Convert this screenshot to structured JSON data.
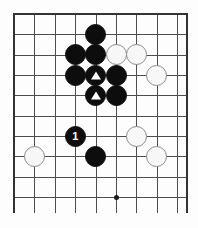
{
  "diagram": {
    "type": "go-board-diagram",
    "board": {
      "columns": 9,
      "rows": 10,
      "origin_x": 14,
      "origin_y": 14,
      "spacing_x": 20.4,
      "spacing_y": 20.35,
      "line_color": "#4d4d4d",
      "edge_color": "#333333",
      "background_color": "#fdfdfd",
      "edges": [
        "top",
        "left",
        "right"
      ]
    },
    "star_points": [
      {
        "name": "star-point-upper",
        "col": 5,
        "row": 3
      },
      {
        "name": "star-point-lower",
        "col": 5,
        "row": 9
      }
    ],
    "stones": [
      {
        "name": "black-stone-a",
        "color": "black",
        "col": 4,
        "row": 1,
        "label": "",
        "marker": ""
      },
      {
        "name": "black-stone-b",
        "color": "black",
        "col": 4,
        "row": 2,
        "label": "",
        "marker": ""
      },
      {
        "name": "black-stone-c",
        "color": "black",
        "col": 3,
        "row": 2,
        "label": "",
        "marker": ""
      },
      {
        "name": "black-stone-d",
        "color": "black",
        "col": 3,
        "row": 3,
        "label": "",
        "marker": ""
      },
      {
        "name": "black-stone-marked-upper",
        "color": "black",
        "col": 4,
        "row": 3,
        "label": "",
        "marker": "triangle"
      },
      {
        "name": "black-stone-e",
        "color": "black",
        "col": 5,
        "row": 3,
        "label": "",
        "marker": ""
      },
      {
        "name": "black-stone-marked-lower",
        "color": "black",
        "col": 4,
        "row": 4,
        "label": "",
        "marker": "triangle"
      },
      {
        "name": "black-stone-f",
        "color": "black",
        "col": 5,
        "row": 4,
        "label": "",
        "marker": ""
      },
      {
        "name": "black-stone-move-1",
        "color": "black",
        "col": 3,
        "row": 6,
        "label": "1",
        "marker": ""
      },
      {
        "name": "black-stone-g",
        "color": "black",
        "col": 4,
        "row": 7,
        "label": "",
        "marker": ""
      },
      {
        "name": "white-stone-a",
        "color": "white",
        "col": 5,
        "row": 2,
        "label": "",
        "marker": ""
      },
      {
        "name": "white-stone-b",
        "color": "white",
        "col": 6,
        "row": 2,
        "label": "",
        "marker": ""
      },
      {
        "name": "white-stone-c",
        "color": "white",
        "col": 7,
        "row": 3,
        "label": "",
        "marker": ""
      },
      {
        "name": "white-stone-d",
        "color": "white",
        "col": 6,
        "row": 6,
        "label": "",
        "marker": ""
      },
      {
        "name": "white-stone-e",
        "color": "white",
        "col": 7,
        "row": 7,
        "label": "",
        "marker": ""
      },
      {
        "name": "white-stone-f",
        "color": "white",
        "col": 1,
        "row": 7,
        "label": "",
        "marker": ""
      }
    ]
  }
}
